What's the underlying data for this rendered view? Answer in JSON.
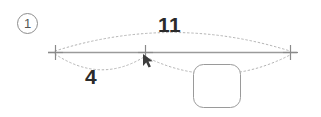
{
  "diagram": {
    "type": "cad-dimension-sketch",
    "background_color": "#ffffff",
    "step_marker": {
      "label": "1",
      "shape": "circled-number",
      "border_color": "#8d8d8d",
      "text_color": "#555555",
      "x": 27,
      "y": 23
    },
    "baseline": {
      "color": "#9a9a9a",
      "y": 52,
      "x_start": 48,
      "x_end": 297
    },
    "ticks": [
      {
        "name": "left-tick",
        "glyph": "plus",
        "x": 55,
        "y": 52,
        "color": "#8a8a8a"
      },
      {
        "name": "middle-tick",
        "glyph": "plus",
        "x": 145,
        "y": 52,
        "color": "#8a8a8a"
      },
      {
        "name": "right-tick",
        "glyph": "plus",
        "x": 290,
        "y": 52,
        "color": "#8a8a8a"
      }
    ],
    "dimensions": [
      {
        "name": "overall-dimension",
        "value": "11",
        "arc": "upper",
        "from_x": 55,
        "to_x": 290,
        "apex_y": 23,
        "label_x": 158,
        "label_y": 14,
        "line_style": "dotted",
        "line_color": "#b4b4b4",
        "text_color": "#2b2b2b"
      },
      {
        "name": "segment-dimension",
        "value": "4",
        "arc": "lower-left",
        "from_x": 55,
        "to_x": 145,
        "apex_y": 78,
        "label_x": 85,
        "label_y": 66,
        "line_style": "dotted",
        "line_color": "#b4b4b4",
        "text_color": "#2b2b2b"
      },
      {
        "name": "remainder-arc",
        "value": "",
        "arc": "lower-right",
        "from_x": 145,
        "to_x": 290,
        "apex_y": 84,
        "line_style": "dotted",
        "line_color": "#b4b4b4"
      }
    ],
    "shapes": [
      {
        "name": "rounded-square",
        "kind": "rounded-rect",
        "x": 193,
        "y": 64,
        "width": 48,
        "height": 44,
        "corner_radius": 10,
        "stroke_color": "#9a9a9a",
        "fill_color": "#ffffff"
      }
    ],
    "cursor": {
      "name": "mouse-cursor",
      "kind": "arrow-pointer",
      "x": 143,
      "y": 56,
      "color": "#3c3c3c"
    }
  }
}
